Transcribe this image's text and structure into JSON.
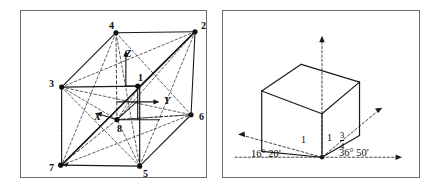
{
  "figure": {
    "background_color": "#ffffff",
    "line_color": "#0d0d0d",
    "frame_color": "#6d6d6d"
  },
  "left_panel": {
    "name": "cube-with-numbered-vertices-and-axes",
    "vertices": [
      {
        "label": "4",
        "x": 96,
        "y": 22,
        "lx": 88,
        "ly": 10
      },
      {
        "label": "2",
        "x": 176,
        "y": 21,
        "lx": 180,
        "ly": 10
      },
      {
        "label": "3",
        "x": 41,
        "y": 77,
        "lx": 28,
        "ly": 68
      },
      {
        "label": "1",
        "x": 118,
        "y": 76,
        "lx": 117,
        "ly": 62
      },
      {
        "label": "6",
        "x": 172,
        "y": 105,
        "lx": 178,
        "ly": 101
      },
      {
        "label": "8",
        "x": 97,
        "y": 110,
        "lx": 96,
        "ly": 113
      },
      {
        "label": "7",
        "x": 40,
        "y": 156,
        "lx": 28,
        "ly": 152
      },
      {
        "label": "5",
        "x": 120,
        "y": 157,
        "lx": 122,
        "ly": 158
      }
    ],
    "axes": [
      {
        "label": "Z",
        "lx": 104,
        "ly": 38
      },
      {
        "label": "Y",
        "lx": 143,
        "ly": 85
      },
      {
        "label": "X",
        "lx": 73,
        "ly": 101
      }
    ]
  },
  "right_panel": {
    "name": "cube-with-angle-annotations",
    "edge_labels": [
      {
        "text": "1",
        "x": 78,
        "y": 124
      },
      {
        "text": "1",
        "x": 104,
        "y": 122
      }
    ],
    "fraction_label": {
      "numerator": "3",
      "denominator": "4",
      "x": 118,
      "y": 122
    },
    "angle_labels": [
      {
        "text": "16° 20′",
        "x": 28,
        "y": 143
      },
      {
        "text": "36° 50′",
        "x": 116,
        "y": 142
      }
    ]
  }
}
